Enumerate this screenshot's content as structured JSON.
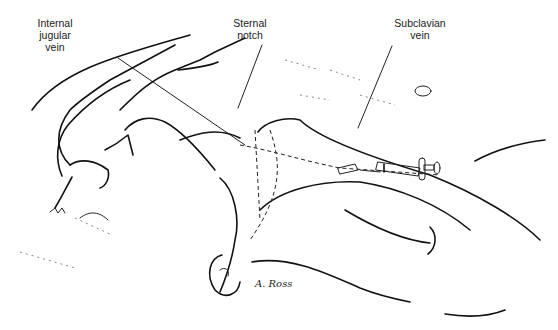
{
  "figure": {
    "labels": {
      "internal_jugular_vein": "Internal jugular vein",
      "sternal_notch": "Sternal notch",
      "subclavian_vein": "Subclavian vein"
    },
    "label_lines": {
      "internal_jugular_vein": [
        "Internal",
        "jugular",
        "vein"
      ],
      "sternal_notch": [
        "Sternal",
        "notch"
      ],
      "subclavian_vein": [
        "Subclavian",
        "vein"
      ]
    },
    "signature": "A. Ross",
    "colors": {
      "ink": "#111111",
      "background": "#ffffff"
    }
  }
}
